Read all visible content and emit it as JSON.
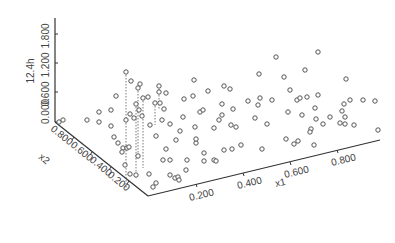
{
  "chart_data": {
    "type": "scatter3d",
    "title": "",
    "axes": {
      "x1": {
        "label": "x1",
        "ticks": [
          "0.200",
          "0.400",
          "0.600",
          "0.800"
        ]
      },
      "x2": {
        "label": "x2",
        "ticks": [
          "0.800",
          "0.600",
          "0.400",
          "0.200"
        ]
      },
      "z": {
        "label": "12.4h",
        "ticks": [
          "0.000",
          "0.600",
          "1.200",
          "1.800"
        ]
      }
    },
    "grid": false,
    "legend": null,
    "marker": "open-circle",
    "drop_lines": "dashed (for elevated points)",
    "screen_points": [
      [
        59,
        122
      ],
      [
        63,
        120
      ],
      [
        87,
        120
      ],
      [
        99,
        112
      ],
      [
        99,
        122
      ],
      [
        111,
        110
      ],
      [
        111,
        126
      ],
      [
        116,
        96
      ],
      [
        114,
        137
      ],
      [
        118,
        143
      ],
      [
        123,
        148
      ],
      [
        122,
        152
      ],
      [
        127,
        148
      ],
      [
        126,
        120
      ],
      [
        129,
        147
      ],
      [
        125,
        165
      ],
      [
        130,
        174
      ],
      [
        136,
        175
      ],
      [
        138,
        156
      ],
      [
        149,
        174
      ],
      [
        153,
        187
      ],
      [
        156,
        183
      ],
      [
        170,
        175
      ],
      [
        175,
        178
      ],
      [
        178,
        177
      ],
      [
        163,
        160
      ],
      [
        170,
        160
      ],
      [
        179,
        180
      ],
      [
        186,
        170
      ],
      [
        187,
        160
      ],
      [
        196,
        143
      ],
      [
        196,
        139
      ],
      [
        200,
        112
      ],
      [
        204,
        153
      ],
      [
        204,
        161
      ],
      [
        214,
        160
      ],
      [
        216,
        161
      ],
      [
        224,
        150
      ],
      [
        126,
        72
      ],
      [
        130,
        114
      ],
      [
        131,
        81
      ],
      [
        134,
        118
      ],
      [
        136,
        104
      ],
      [
        138,
        88
      ],
      [
        139,
        110
      ],
      [
        140,
        84
      ],
      [
        143,
        98
      ],
      [
        142,
        116
      ],
      [
        148,
        97
      ],
      [
        150,
        125
      ],
      [
        155,
        103
      ],
      [
        156,
        136
      ],
      [
        159,
        86
      ],
      [
        159,
        92
      ],
      [
        160,
        103
      ],
      [
        164,
        109
      ],
      [
        162,
        120
      ],
      [
        166,
        149
      ],
      [
        166,
        93
      ],
      [
        170,
        124
      ],
      [
        176,
        140
      ],
      [
        180,
        131
      ],
      [
        183,
        117
      ],
      [
        184,
        99
      ],
      [
        193,
        96
      ],
      [
        194,
        80
      ],
      [
        195,
        127
      ],
      [
        203,
        110
      ],
      [
        208,
        91
      ],
      [
        214,
        128
      ],
      [
        219,
        120
      ],
      [
        222,
        104
      ],
      [
        222,
        115
      ],
      [
        224,
        86
      ],
      [
        230,
        89
      ],
      [
        231,
        125
      ],
      [
        233,
        109
      ],
      [
        236,
        127
      ],
      [
        232,
        149
      ],
      [
        241,
        145
      ],
      [
        248,
        101
      ],
      [
        260,
        98
      ],
      [
        255,
        118
      ],
      [
        258,
        105
      ],
      [
        262,
        149
      ],
      [
        267,
        124
      ],
      [
        272,
        100
      ],
      [
        284,
        77
      ],
      [
        288,
        112
      ],
      [
        290,
        90
      ],
      [
        297,
        100
      ],
      [
        300,
        98
      ],
      [
        302,
        115
      ],
      [
        307,
        97
      ],
      [
        294,
        144
      ],
      [
        298,
        141
      ],
      [
        311,
        129
      ],
      [
        316,
        119
      ],
      [
        315,
        108
      ],
      [
        318,
        52
      ],
      [
        314,
        145
      ],
      [
        318,
        95
      ],
      [
        323,
        124
      ],
      [
        345,
        124
      ],
      [
        345,
        117
      ],
      [
        330,
        117
      ],
      [
        340,
        123
      ],
      [
        342,
        111
      ],
      [
        344,
        104
      ],
      [
        350,
        100
      ],
      [
        354,
        125
      ],
      [
        346,
        79
      ],
      [
        276,
        57
      ],
      [
        259,
        74
      ],
      [
        305,
        70
      ],
      [
        286,
        139
      ],
      [
        310,
        132
      ],
      [
        363,
        100
      ],
      [
        375,
        101
      ],
      [
        378,
        130
      ]
    ],
    "drop_line_points": [
      [
        126,
        72,
        126,
        190
      ],
      [
        136,
        104,
        136,
        178
      ],
      [
        138,
        88,
        138,
        160
      ],
      [
        143,
        98,
        143,
        168
      ],
      [
        155,
        103,
        155,
        125
      ],
      [
        159,
        86,
        159,
        110
      ]
    ]
  }
}
